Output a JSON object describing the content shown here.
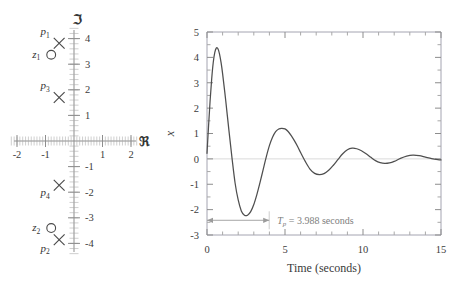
{
  "figure": {
    "background": "#ffffff",
    "curve_color": "#4f4f4f",
    "axis_color": "#8d8d8d",
    "annotation_color": "#9b9b9b"
  },
  "pole_zero_plot": {
    "name": "pole-zero-map",
    "imag_axis_symbol": "ℑ",
    "real_axis_symbol": "ℜ",
    "real_ticks": [
      "-2",
      "-1",
      "1",
      "2"
    ],
    "real_tick_values": [
      -2,
      -1,
      1,
      2
    ],
    "imag_ticks": [
      "4",
      "3",
      "2",
      "1",
      "-1",
      "-2",
      "-3",
      "-4"
    ],
    "imag_tick_values": [
      4,
      3,
      2,
      1,
      -1,
      -2,
      -3,
      -4
    ],
    "xlim": [
      -2.35,
      2.35
    ],
    "ylim": [
      -4.45,
      4.45
    ],
    "markers": [
      {
        "id": "p1",
        "type": "pole",
        "label_base": "p",
        "label_sub": "1",
        "re": -0.52,
        "im": 3.82,
        "label_dx": -14,
        "label_dy": -8
      },
      {
        "id": "z1",
        "type": "zero",
        "label_base": "z",
        "label_sub": "1",
        "re": -0.8,
        "im": 3.37,
        "label_dx": -15,
        "label_dy": 3
      },
      {
        "id": "p3",
        "type": "pole",
        "label_base": "p",
        "label_sub": "3",
        "re": -0.52,
        "im": 1.7,
        "label_dx": -14,
        "label_dy": -8
      },
      {
        "id": "p4",
        "type": "pole",
        "label_base": "p",
        "label_sub": "4",
        "re": -0.52,
        "im": -1.73,
        "label_dx": -14,
        "label_dy": 11
      },
      {
        "id": "z2",
        "type": "zero",
        "label_base": "z",
        "label_sub": "2",
        "re": -0.8,
        "im": -3.4,
        "label_dx": -15,
        "label_dy": 3
      },
      {
        "id": "p2",
        "type": "pole",
        "label_base": "p",
        "label_sub": "2",
        "re": -0.52,
        "im": -3.86,
        "label_dx": -14,
        "label_dy": 12
      }
    ]
  },
  "chart_data": {
    "type": "line",
    "name": "step-response-plot",
    "title": "",
    "xlabel": "Time (seconds)",
    "ylabel_base": "x",
    "ylabel_sub": "2",
    "ylabel_arg": "(t)",
    "ylabel_unit": "(cm)",
    "ylabel": "x2(t) (cm)",
    "xlim": [
      0,
      15
    ],
    "ylim": [
      -3,
      5
    ],
    "xticks": [
      0,
      5,
      10,
      15
    ],
    "xticklabels": [
      "0",
      "5",
      "10",
      "15"
    ],
    "yticks": [
      -3,
      -2,
      -1,
      0,
      1,
      2,
      3,
      4,
      5
    ],
    "yticklabels": [
      "-3",
      "-2",
      "-1",
      "0",
      "1",
      "2",
      "3",
      "4",
      "5"
    ],
    "x_minor_step": 1,
    "y_minor_step": 0.5,
    "grid": false,
    "legend": null,
    "series": [
      {
        "name": "x2(t)",
        "color": "#4f4f4f",
        "x": [
          0.0,
          0.1,
          0.2,
          0.3,
          0.4,
          0.5,
          0.6,
          0.7,
          0.8,
          0.9,
          1.0,
          1.2,
          1.4,
          1.6,
          1.8,
          2.0,
          2.2,
          2.4,
          2.6,
          2.8,
          3.0,
          3.2,
          3.4,
          3.6,
          3.8,
          4.0,
          4.2,
          4.4,
          4.6,
          4.8,
          5.0,
          5.2,
          5.4,
          5.6,
          5.8,
          6.0,
          6.3,
          6.6,
          6.9,
          7.2,
          7.5,
          7.8,
          8.1,
          8.4,
          8.7,
          9.0,
          9.3,
          9.6,
          9.9,
          10.2,
          10.5,
          10.8,
          11.1,
          11.4,
          11.7,
          12.0,
          12.4,
          12.8,
          13.2,
          13.6,
          14.0,
          14.4,
          14.8,
          15.0
        ],
        "y": [
          0.22,
          1.3,
          2.3,
          3.15,
          3.8,
          4.2,
          4.37,
          4.34,
          4.14,
          3.8,
          3.36,
          2.3,
          1.15,
          0.05,
          -0.95,
          -1.62,
          -2.05,
          -2.22,
          -2.22,
          -2.08,
          -1.8,
          -1.4,
          -0.93,
          -0.42,
          0.08,
          0.52,
          0.85,
          1.07,
          1.18,
          1.2,
          1.18,
          1.08,
          0.92,
          0.72,
          0.5,
          0.25,
          -0.1,
          -0.4,
          -0.57,
          -0.62,
          -0.58,
          -0.45,
          -0.25,
          -0.02,
          0.2,
          0.36,
          0.42,
          0.4,
          0.32,
          0.2,
          0.06,
          -0.07,
          -0.15,
          -0.18,
          -0.16,
          -0.1,
          0.02,
          0.11,
          0.15,
          0.13,
          0.07,
          0.01,
          -0.03,
          -0.04
        ]
      }
    ],
    "annotations": [
      {
        "id": "peak-time-annotation",
        "text_base": "T",
        "text_sub": "p",
        "text_rest": " = 3.988 seconds",
        "text": "Tp = 3.988 seconds",
        "x_start": 0.0,
        "x_end": 3.988,
        "y": -2.42
      }
    ]
  }
}
